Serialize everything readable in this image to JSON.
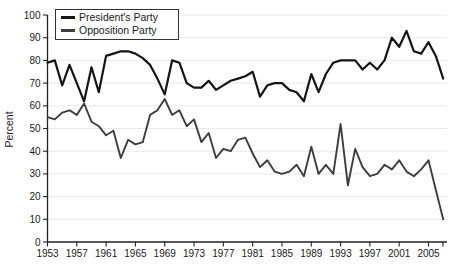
{
  "chart_data": {
    "type": "line",
    "title": "",
    "xlabel": "",
    "ylabel": "Percent",
    "ylim": [
      0,
      100
    ],
    "yticks": [
      0,
      10,
      20,
      30,
      40,
      50,
      60,
      70,
      80,
      90,
      100
    ],
    "xtick_years": [
      1953,
      1957,
      1961,
      1965,
      1969,
      1973,
      1977,
      1981,
      1985,
      1989,
      1993,
      1997,
      2001,
      2005
    ],
    "grid": "horizontal-light",
    "legend_position": "top-left",
    "axis_color": "#222222",
    "grid_color": "#e2e2e2",
    "x": [
      1953,
      1954,
      1955,
      1956,
      1957,
      1958,
      1959,
      1960,
      1961,
      1962,
      1963,
      1964,
      1965,
      1966,
      1967,
      1968,
      1969,
      1970,
      1971,
      1972,
      1973,
      1974,
      1975,
      1976,
      1977,
      1978,
      1979,
      1980,
      1981,
      1982,
      1983,
      1984,
      1985,
      1986,
      1987,
      1988,
      1989,
      1990,
      1991,
      1992,
      1993,
      1994,
      1995,
      1996,
      1997,
      1998,
      1999,
      2000,
      2001,
      2002,
      2003,
      2004,
      2005,
      2006,
      2007
    ],
    "series": [
      {
        "name": "President's Party",
        "color": "#141414",
        "width": 2.2,
        "values": [
          79,
          80,
          69,
          78,
          70,
          62,
          77,
          66,
          82,
          83,
          84,
          84,
          83,
          81,
          78,
          72,
          65,
          80,
          79,
          70,
          68,
          68,
          71,
          67,
          69,
          71,
          72,
          73,
          75,
          64,
          69,
          70,
          70,
          67,
          66,
          62,
          74,
          66,
          74,
          79,
          80,
          80,
          80,
          76,
          79,
          76,
          80,
          90,
          86,
          93,
          84,
          83,
          88,
          82,
          72
        ]
      },
      {
        "name": "Opposition Party",
        "color": "#3d3d3d",
        "width": 1.9,
        "values": [
          55,
          54,
          57,
          58,
          56,
          61,
          53,
          51,
          47,
          49,
          37,
          45,
          43,
          44,
          56,
          58,
          63,
          56,
          58,
          51,
          54,
          44,
          48,
          37,
          41,
          40,
          45,
          46,
          39,
          33,
          36,
          31,
          30,
          31,
          34,
          29,
          42,
          30,
          34,
          30,
          52,
          25,
          41,
          33,
          29,
          30,
          34,
          32,
          36,
          31,
          29,
          32,
          36,
          23,
          10
        ]
      }
    ]
  }
}
